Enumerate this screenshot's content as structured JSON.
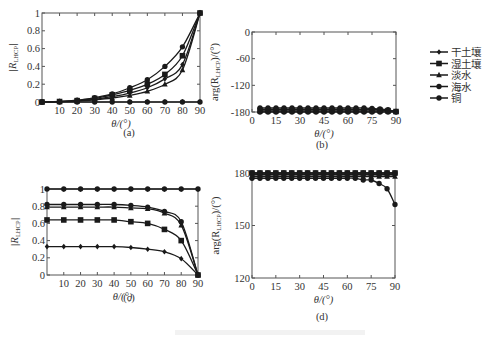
{
  "chart_data": [
    {
      "id": "a",
      "type": "line",
      "panel_label": "(a)",
      "title": "",
      "xlabel": "θ/(°)",
      "ylabel": "|R_LHCP|",
      "xlim": [
        0,
        90
      ],
      "ylim": [
        0,
        1
      ],
      "xticks": [
        10,
        20,
        30,
        40,
        50,
        60,
        70,
        80,
        90
      ],
      "yticks": [
        0,
        0.2,
        0.4,
        0.6,
        0.8,
        1
      ],
      "ytick_labels": [
        "0",
        "0.2",
        "0.4",
        "0.6",
        "0.8",
        "1"
      ],
      "x": [
        0,
        10,
        20,
        30,
        40,
        50,
        60,
        70,
        80,
        90
      ],
      "series": [
        {
          "name": "干土壤",
          "marker": "diamond",
          "values": [
            0,
            0.005,
            0.015,
            0.03,
            0.06,
            0.1,
            0.16,
            0.26,
            0.42,
            1.0
          ]
        },
        {
          "name": "湿土壤",
          "marker": "square",
          "values": [
            0,
            0.005,
            0.015,
            0.04,
            0.08,
            0.13,
            0.2,
            0.31,
            0.52,
            1.0
          ]
        },
        {
          "name": "淡水",
          "marker": "triangle",
          "values": [
            0,
            0.003,
            0.01,
            0.025,
            0.045,
            0.075,
            0.12,
            0.2,
            0.36,
            1.0
          ]
        },
        {
          "name": "海水",
          "marker": "circle",
          "values": [
            0,
            0.006,
            0.02,
            0.05,
            0.09,
            0.16,
            0.25,
            0.4,
            0.62,
            1.0
          ]
        },
        {
          "name": "铜",
          "marker": "circle",
          "values": [
            0,
            0,
            0,
            0,
            0,
            0,
            0,
            0,
            0,
            0
          ]
        }
      ]
    },
    {
      "id": "b",
      "type": "line",
      "panel_label": "(b)",
      "xlabel": "θ/(°)",
      "ylabel": "arg(R_LHCP)/(°)",
      "xlim": [
        0,
        90
      ],
      "ylim": [
        -180,
        0
      ],
      "xticks": [
        0,
        15,
        30,
        45,
        60,
        75,
        90
      ],
      "yticks": [
        -180,
        -120,
        -60,
        0
      ],
      "x": [
        5,
        10,
        15,
        20,
        25,
        30,
        35,
        40,
        45,
        50,
        55,
        60,
        65,
        70,
        75,
        80,
        85,
        90
      ],
      "series": [
        {
          "name": "干土壤",
          "marker": "diamond",
          "values": [
            -174,
            -174,
            -174,
            -174,
            -174,
            -174,
            -174,
            -174,
            -174,
            -174,
            -174,
            -174,
            -174,
            -174,
            -174,
            -175,
            -176,
            -179
          ]
        },
        {
          "name": "湿土壤",
          "marker": "square",
          "values": [
            -176,
            -176,
            -176,
            -176,
            -176,
            -176,
            -176,
            -176,
            -176,
            -176,
            -176,
            -176,
            -176,
            -176,
            -176,
            -176,
            -177,
            -179
          ]
        },
        {
          "name": "淡水",
          "marker": "triangle",
          "values": [
            -178,
            -178,
            -178,
            -178,
            -178,
            -178,
            -178,
            -178,
            -178,
            -178,
            -178,
            -178,
            -178,
            -178,
            -178,
            -178,
            -178,
            -179
          ]
        },
        {
          "name": "海水",
          "marker": "circle",
          "values": [
            -171,
            -171,
            -171,
            -171,
            -171,
            -171,
            -171,
            -171,
            -171,
            -171,
            -171,
            -171,
            -171,
            -171,
            -172,
            -173,
            -175,
            -179
          ]
        },
        {
          "name": "铜",
          "marker": "circle",
          "values": [
            -180,
            -180,
            -180,
            -180,
            -180,
            -180,
            -180,
            -180,
            -180,
            -180,
            -180,
            -180,
            -180,
            -180,
            -180,
            -180,
            -180,
            -180
          ]
        }
      ]
    },
    {
      "id": "c",
      "type": "line",
      "panel_label": "(c)",
      "xlabel": "θ/(°)",
      "ylabel": "|R_LHCP|",
      "xlim": [
        0,
        90
      ],
      "ylim": [
        0,
        1
      ],
      "xticks": [
        10,
        20,
        30,
        40,
        50,
        60,
        70,
        80,
        90
      ],
      "yticks": [
        0,
        0.2,
        0.4,
        0.6,
        0.8,
        1
      ],
      "ytick_labels": [
        "0",
        "0.2",
        "0.4",
        "0.6",
        "0.8",
        "1"
      ],
      "x": [
        0,
        10,
        20,
        30,
        40,
        50,
        60,
        70,
        80,
        90
      ],
      "series": [
        {
          "name": "干土壤",
          "marker": "diamond",
          "values": [
            0.33,
            0.33,
            0.33,
            0.33,
            0.33,
            0.32,
            0.3,
            0.27,
            0.19,
            0
          ]
        },
        {
          "name": "湿土壤",
          "marker": "square",
          "values": [
            0.64,
            0.64,
            0.64,
            0.64,
            0.64,
            0.62,
            0.6,
            0.53,
            0.4,
            0
          ]
        },
        {
          "name": "淡水",
          "marker": "triangle",
          "values": [
            0.79,
            0.79,
            0.79,
            0.79,
            0.79,
            0.78,
            0.77,
            0.72,
            0.58,
            0
          ]
        },
        {
          "name": "海水",
          "marker": "circle",
          "values": [
            0.82,
            0.82,
            0.82,
            0.82,
            0.82,
            0.81,
            0.79,
            0.74,
            0.62,
            0
          ]
        },
        {
          "name": "铜",
          "marker": "circle",
          "values": [
            1,
            1,
            1,
            1,
            1,
            1,
            1,
            1,
            1,
            1
          ]
        }
      ]
    },
    {
      "id": "d",
      "type": "line",
      "panel_label": "(d)",
      "xlabel": "θ/(°)",
      "ylabel": "arg(R_LHCP)/(°)",
      "xlim": [
        0,
        90
      ],
      "ylim": [
        120,
        180
      ],
      "xticks": [
        0,
        15,
        30,
        45,
        60,
        75,
        90
      ],
      "yticks": [
        120,
        150,
        180
      ],
      "x": [
        0,
        5,
        10,
        15,
        20,
        25,
        30,
        35,
        40,
        45,
        50,
        55,
        60,
        65,
        70,
        75,
        80,
        85,
        90
      ],
      "series": [
        {
          "name": "干土壤",
          "marker": "diamond",
          "values": [
            179,
            179,
            179,
            179,
            179,
            179,
            179,
            179,
            179,
            179,
            179,
            179,
            179,
            179,
            179,
            179,
            179,
            179,
            179
          ]
        },
        {
          "name": "湿土壤",
          "marker": "square",
          "values": [
            180,
            180,
            180,
            180,
            180,
            180,
            180,
            180,
            180,
            180,
            180,
            180,
            180,
            180,
            180,
            180,
            180,
            180,
            180
          ]
        },
        {
          "name": "淡水",
          "marker": "triangle",
          "values": [
            178,
            178,
            178,
            178,
            178,
            178,
            178,
            178,
            178,
            178,
            178,
            178,
            178,
            178,
            178,
            178,
            178,
            178,
            178
          ]
        },
        {
          "name": "海水",
          "marker": "circle",
          "values": [
            177,
            177,
            177,
            177,
            177,
            177,
            177,
            177,
            177,
            177,
            177,
            177,
            177,
            177,
            176,
            176,
            174,
            171,
            162
          ]
        },
        {
          "name": "铜",
          "marker": "circle",
          "values": [
            180,
            180,
            180,
            180,
            180,
            180,
            180,
            180,
            180,
            180,
            180,
            180,
            180,
            180,
            180,
            180,
            180,
            180,
            180
          ]
        }
      ]
    }
  ],
  "legend": {
    "position": "right",
    "items": [
      {
        "label": "干土壤",
        "marker": "diamond"
      },
      {
        "label": "湿土壤",
        "marker": "square"
      },
      {
        "label": "淡水",
        "marker": "triangle"
      },
      {
        "label": "海水",
        "marker": "circle"
      },
      {
        "label": "铜",
        "marker": "circle"
      }
    ]
  },
  "labels": {
    "a_xlabel": "θ/(°)",
    "a_ylabel": "|R",
    "b_xlabel": "θ/(°)",
    "c_xlabel": "θ/(°)",
    "d_xlabel": "θ/(°)",
    "ylabel_mag": "|R_LHCP|",
    "ylabel_arg": "arg(R_LHCP)/(°)",
    "panel_a": "(a)",
    "panel_b": "(b)",
    "panel_c": "(c)",
    "panel_d": "(d)"
  }
}
